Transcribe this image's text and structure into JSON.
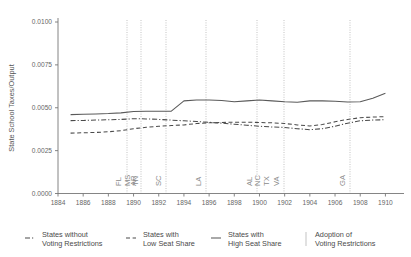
{
  "chart_data": {
    "type": "line",
    "title": "",
    "xlabel": "",
    "ylabel": "State School Taxes/Output",
    "xlim": [
      1884,
      1911
    ],
    "ylim": [
      0.0,
      0.0105
    ],
    "grid": false,
    "legend_position": "bottom",
    "xticks": [
      "1884",
      "1886",
      "1888",
      "1890",
      "1892",
      "1894",
      "1896",
      "1898",
      "1900",
      "1902",
      "1904",
      "1906",
      "1908",
      "1910"
    ],
    "yticks": [
      "0.0000",
      "0.0025",
      "0.0050",
      "0.0075",
      "0.0100"
    ],
    "x": [
      1885,
      1886,
      1887,
      1888,
      1889,
      1890,
      1891,
      1892,
      1893,
      1894,
      1895,
      1896,
      1897,
      1898,
      1899,
      1900,
      1901,
      1902,
      1903,
      1904,
      1905,
      1906,
      1907,
      1908,
      1909,
      1910
    ],
    "series": [
      {
        "name": "States with High Seat Share",
        "style": "solid",
        "color": "#5a5a5a",
        "values": [
          0.0046,
          0.00462,
          0.00464,
          0.00466,
          0.0047,
          0.00478,
          0.0048,
          0.0048,
          0.0048,
          0.0054,
          0.00545,
          0.00545,
          0.00542,
          0.00535,
          0.0054,
          0.00545,
          0.0054,
          0.00535,
          0.00532,
          0.0054,
          0.0054,
          0.00538,
          0.00533,
          0.00535,
          0.00555,
          0.00585
        ]
      },
      {
        "name": "States without Voting Restrictions",
        "style": "dashdot",
        "color": "#4a4a4a",
        "values": [
          0.00425,
          0.00426,
          0.00428,
          0.0043,
          0.00432,
          0.00436,
          0.00435,
          0.00432,
          0.00428,
          0.00424,
          0.0042,
          0.00415,
          0.0041,
          0.00404,
          0.00398,
          0.00392,
          0.00388,
          0.00385,
          0.00378,
          0.00372,
          0.00378,
          0.00392,
          0.0041,
          0.00424,
          0.00428,
          0.0043
        ]
      },
      {
        "name": "States with Low Seat Share",
        "style": "dashed",
        "color": "#4a4a4a",
        "values": [
          0.00352,
          0.00354,
          0.00356,
          0.0036,
          0.00366,
          0.00378,
          0.00386,
          0.00392,
          0.00396,
          0.004,
          0.00408,
          0.00412,
          0.00414,
          0.00416,
          0.00416,
          0.00414,
          0.00412,
          0.00408,
          0.004,
          0.00394,
          0.00402,
          0.00418,
          0.00432,
          0.00442,
          0.00446,
          0.00448
        ]
      }
    ],
    "adoption_events": [
      {
        "label": "FL",
        "year": 1889,
        "x_px": 127
      },
      {
        "label": "MS",
        "year": 1890,
        "x_px": 127
      },
      {
        "label": "TN",
        "year": 1890,
        "x_px": 127
      },
      {
        "label": "AR",
        "year": 1891,
        "x_px": 141
      },
      {
        "label": "SC",
        "year": 1893,
        "x_px": 166
      },
      {
        "label": "LA",
        "year": 1896,
        "x_px": 206
      },
      {
        "label": "AL",
        "year": 1901,
        "x_px": 257
      },
      {
        "label": "NC",
        "year": 1901,
        "x_px": 264
      },
      {
        "label": "TX",
        "year": 1902,
        "x_px": 271
      },
      {
        "label": "VA",
        "year": 1902,
        "x_px": 284
      },
      {
        "label": "GA",
        "year": 1907,
        "x_px": 350
      }
    ],
    "adoption_line_px": [
      127,
      141,
      166,
      206,
      257,
      284,
      350
    ]
  },
  "legend": {
    "items": [
      {
        "key": "legend-item-no-restrictions",
        "style": "dashdot",
        "line1": "States without",
        "line2": "Voting Restrictions"
      },
      {
        "key": "legend-item-low-seat-share",
        "style": "dashed",
        "line1": "States with",
        "line2": "Low Seat Share"
      },
      {
        "key": "legend-item-high-seat-share",
        "style": "solid",
        "line1": "States with",
        "line2": "High Seat Share"
      },
      {
        "key": "legend-item-adoption",
        "style": "vertical",
        "line1": "Adoption of",
        "line2": "Voting Restrictions"
      }
    ]
  },
  "axes": {
    "ylabel": "State School Taxes/Output"
  }
}
